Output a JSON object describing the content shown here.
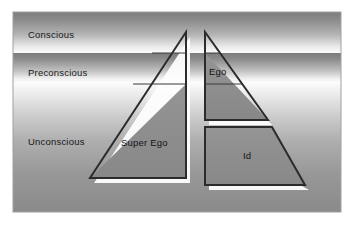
{
  "diagram": {
    "type": "psyche-iceberg-diagram",
    "panel": {
      "background_top_color": "#8c8c8c",
      "background_light_color": "#fbfbfb",
      "border_color": "#9a9a9a"
    },
    "levels": [
      {
        "id": "conscious",
        "label": "Conscious",
        "band_top": 12,
        "band_bottom": 53
      },
      {
        "id": "preconscious",
        "label": "Preconscious",
        "band_top": 53,
        "band_bottom": 83
      },
      {
        "id": "unconscious",
        "label": "Unconscious",
        "band_top": 83,
        "band_bottom": 212
      }
    ],
    "structures": [
      {
        "id": "super-ego",
        "label": "Super Ego",
        "shape": "right-triangle",
        "fill_color": "#8f8f8f",
        "outline_color": "#2b2b2b",
        "shadow_color": "#ffffff"
      },
      {
        "id": "ego",
        "label": "Ego",
        "shape": "triangle-segment",
        "fill_color": "#8f8f8f",
        "outline_color": "#2b2b2b",
        "shadow_color": "#ffffff"
      },
      {
        "id": "id",
        "label": "Id",
        "shape": "trapezoid",
        "fill_color": "#8f8f8f",
        "outline_color": "#2b2b2b",
        "shadow_color": "#ffffff"
      }
    ]
  }
}
